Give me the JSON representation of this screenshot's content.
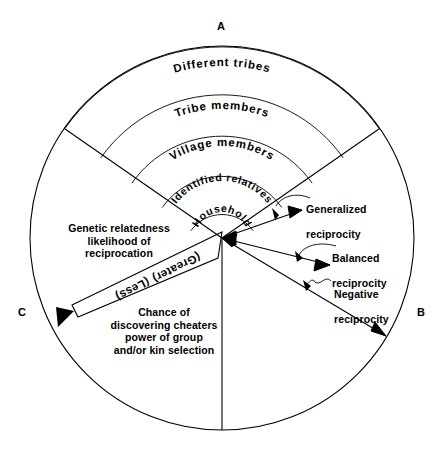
{
  "diagram": {
    "type": "concentric-sector-diagram",
    "title_absent": true,
    "corner_labels": [
      {
        "id": "A",
        "text": "A",
        "position": "top"
      },
      {
        "id": "B",
        "text": "B",
        "position": "right"
      },
      {
        "id": "C",
        "text": "C",
        "position": "left"
      }
    ],
    "rings": [
      {
        "index": 0,
        "label": "Household",
        "radius_outer": 38
      },
      {
        "index": 1,
        "label": "Identified relatives",
        "radius_outer": 73
      },
      {
        "index": 2,
        "label": "Village members",
        "radius_outer": 110
      },
      {
        "index": 3,
        "label": "Tribe members",
        "radius_outer": 148
      },
      {
        "index": 4,
        "label": "Different tribes",
        "radius_outer": 192
      }
    ],
    "reciprocity_labels": [
      {
        "id": "generalized",
        "line1": "Generalized",
        "line2": "reciprocity"
      },
      {
        "id": "balanced",
        "line1": "Balanced",
        "line2": "reciprocity"
      },
      {
        "id": "negative",
        "line1": "Negative",
        "line2": "reciprocity"
      }
    ],
    "gradient_arrow": {
      "greater_label": "(Greater)",
      "less_label": "(Less)"
    },
    "text_blocks": [
      {
        "id": "genetic-relatedness",
        "text": "Genetic relatedness\nlikelihood of\nreciprocation"
      },
      {
        "id": "chance-of-discovering",
        "text": "Chance of\ndiscovering cheaters\npower of group\nand/or kin selection"
      }
    ],
    "colors": {
      "stroke": "#000000",
      "background": "#ffffff",
      "text": "#000000"
    }
  }
}
